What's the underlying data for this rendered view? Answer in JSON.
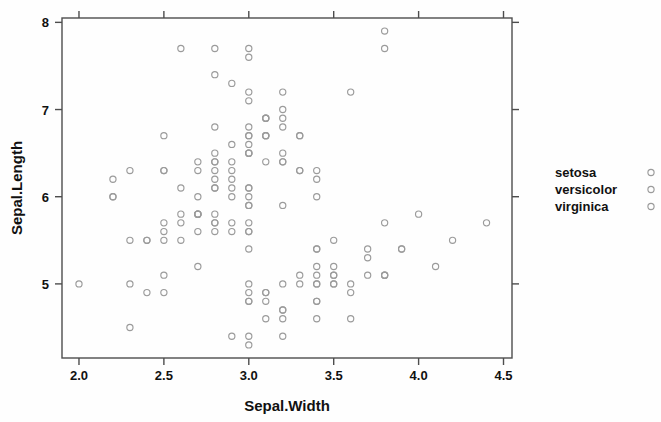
{
  "chart_data": {
    "type": "scatter",
    "title": "",
    "xlabel": "Sepal.Width",
    "ylabel": "Sepal.Length",
    "xlim": [
      1.9,
      4.55
    ],
    "ylim": [
      4.15,
      8.05
    ],
    "xticks": [
      "2.0",
      "2.5",
      "3.0",
      "3.5",
      "4.0",
      "4.5"
    ],
    "xtick_values": [
      2.0,
      2.5,
      3.0,
      3.5,
      4.0,
      4.5
    ],
    "yticks": [
      "5",
      "6",
      "7",
      "8"
    ],
    "ytick_values": [
      5,
      6,
      7,
      8
    ],
    "grid": false,
    "marker": "open-circle",
    "marker_color": "#9b9b9b",
    "box": true,
    "legend_position": "right",
    "legend": [
      "setosa",
      "versicolor",
      "virginica"
    ],
    "series": [
      {
        "name": "setosa",
        "x": [
          3.5,
          3.0,
          3.2,
          3.1,
          3.6,
          3.9,
          3.4,
          3.4,
          2.9,
          3.1,
          3.7,
          3.4,
          3.0,
          3.0,
          4.0,
          4.4,
          3.9,
          3.5,
          3.8,
          3.8,
          3.4,
          3.7,
          3.6,
          3.3,
          3.4,
          3.0,
          3.4,
          3.5,
          3.4,
          3.2,
          3.1,
          3.4,
          4.1,
          4.2,
          3.1,
          3.2,
          3.5,
          3.6,
          3.0,
          3.4,
          3.5,
          2.3,
          3.2,
          3.5,
          3.8,
          3.0,
          3.8,
          3.2,
          3.7,
          3.3
        ],
        "y": [
          5.1,
          4.9,
          4.7,
          4.6,
          5.0,
          5.4,
          4.6,
          5.0,
          4.4,
          4.9,
          5.4,
          4.8,
          4.8,
          4.3,
          5.8,
          5.7,
          5.4,
          5.1,
          5.7,
          5.1,
          5.4,
          5.1,
          4.6,
          5.1,
          4.8,
          5.0,
          5.0,
          5.2,
          5.2,
          4.7,
          4.8,
          5.4,
          5.2,
          5.5,
          4.9,
          5.0,
          5.5,
          4.9,
          4.4,
          5.1,
          5.0,
          4.5,
          4.4,
          5.0,
          5.1,
          4.8,
          5.1,
          4.6,
          5.3,
          5.0
        ]
      },
      {
        "name": "versicolor",
        "x": [
          3.2,
          3.2,
          3.1,
          2.3,
          2.8,
          2.8,
          3.3,
          2.4,
          2.9,
          2.7,
          2.0,
          3.0,
          2.2,
          2.9,
          2.9,
          3.1,
          3.0,
          2.7,
          2.2,
          2.5,
          3.2,
          2.8,
          2.5,
          2.8,
          2.9,
          3.0,
          2.8,
          3.0,
          2.9,
          2.6,
          2.4,
          2.4,
          2.7,
          2.7,
          3.0,
          3.4,
          3.1,
          2.3,
          3.0,
          2.5,
          2.6,
          3.0,
          2.6,
          2.3,
          2.7,
          3.0,
          2.9,
          2.9,
          2.5,
          2.8
        ],
        "y": [
          7.0,
          6.4,
          6.9,
          5.5,
          6.5,
          5.7,
          6.3,
          4.9,
          6.6,
          5.2,
          5.0,
          5.9,
          6.0,
          6.1,
          5.6,
          6.7,
          5.6,
          5.8,
          6.2,
          5.6,
          5.9,
          6.1,
          6.3,
          6.1,
          6.4,
          6.6,
          6.8,
          6.7,
          6.0,
          5.7,
          5.5,
          5.5,
          5.8,
          6.0,
          5.4,
          6.0,
          6.7,
          6.3,
          5.6,
          5.5,
          5.5,
          6.1,
          5.8,
          5.0,
          5.6,
          5.7,
          5.7,
          6.2,
          5.1,
          5.7
        ]
      },
      {
        "name": "virginica",
        "x": [
          3.3,
          2.7,
          3.0,
          2.9,
          3.0,
          3.0,
          2.5,
          2.9,
          2.5,
          3.6,
          3.2,
          2.7,
          3.0,
          2.5,
          2.8,
          3.2,
          3.0,
          3.8,
          2.6,
          2.2,
          3.2,
          2.8,
          2.8,
          2.7,
          3.3,
          3.2,
          2.8,
          3.0,
          2.8,
          3.0,
          2.8,
          3.8,
          2.8,
          2.8,
          2.6,
          3.0,
          3.4,
          3.1,
          3.0,
          3.1,
          3.1,
          3.1,
          2.7,
          3.2,
          3.3,
          3.0,
          2.5,
          3.0,
          3.4,
          3.0
        ],
        "y": [
          6.3,
          5.8,
          7.1,
          6.3,
          6.5,
          7.6,
          4.9,
          7.3,
          6.7,
          7.2,
          6.5,
          6.4,
          6.8,
          5.7,
          5.8,
          6.4,
          6.5,
          7.7,
          7.7,
          6.0,
          6.9,
          5.6,
          7.7,
          6.3,
          6.7,
          7.2,
          6.2,
          6.1,
          6.4,
          7.2,
          7.4,
          7.9,
          6.4,
          6.3,
          6.1,
          7.7,
          6.3,
          6.4,
          6.0,
          6.9,
          6.7,
          6.9,
          5.8,
          6.8,
          6.7,
          6.7,
          6.3,
          6.5,
          6.2,
          5.9
        ]
      }
    ]
  },
  "legend": {
    "items": [
      {
        "label": "setosa",
        "marker": "open-circle"
      },
      {
        "label": "versicolor",
        "marker": "open-circle"
      },
      {
        "label": "virginica",
        "marker": "open-circle"
      }
    ]
  },
  "axes": {
    "x_title": "Sepal.Width",
    "y_title": "Sepal.Length",
    "x_tick_labels": [
      "2.0",
      "2.5",
      "3.0",
      "3.5",
      "4.0",
      "4.5"
    ],
    "y_tick_labels": [
      "5",
      "6",
      "7",
      "8"
    ]
  },
  "colors": {
    "marker_stroke": "#9b9b9b",
    "axis": "#4d4d4d",
    "text": "#111111",
    "background": "#fefefe"
  }
}
